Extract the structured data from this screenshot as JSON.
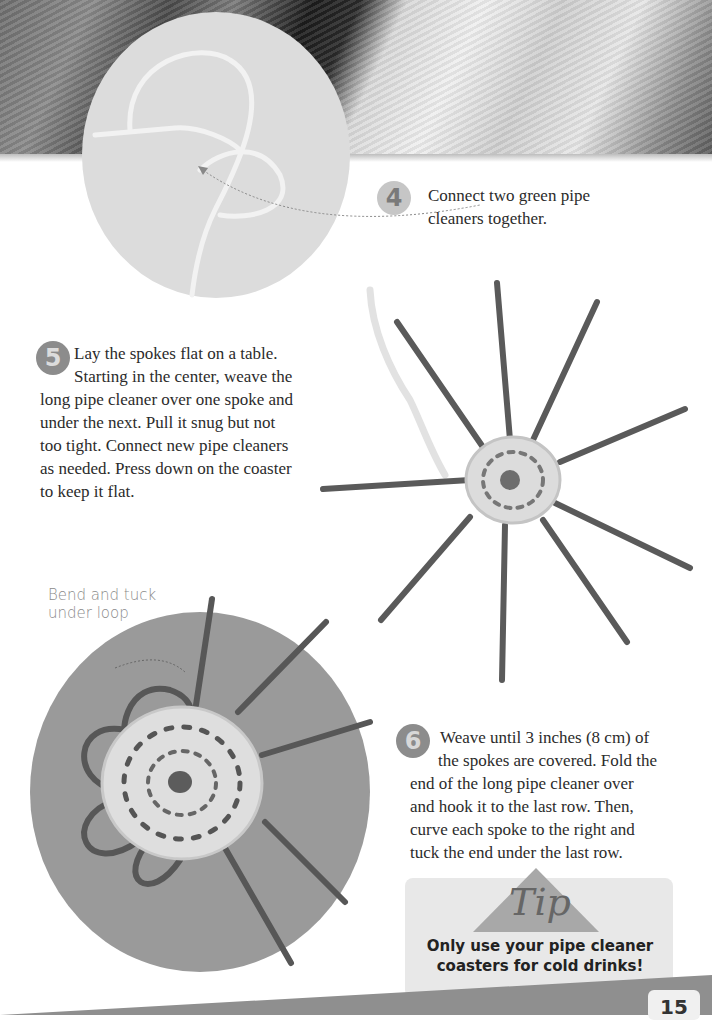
{
  "steps": [
    {
      "number": "4",
      "lines": [
        "Connect two green pipe",
        "cleaners together."
      ]
    },
    {
      "number": "5",
      "lines": [
        "Lay the spokes flat on a table.",
        "Starting in the center, weave the",
        "long pipe cleaner over one spoke and",
        "under the next. Pull it snug but not",
        "too tight. Connect new pipe cleaners",
        "as needed. Press down on the coaster",
        "to keep it flat."
      ]
    },
    {
      "number": "6",
      "lines": [
        "Weave until 3 inches (8 cm) of",
        "the spokes are covered. Fold the",
        "end of the long pipe cleaner over",
        "and hook it to the last row. Then,",
        "curve each spoke to the right and",
        "tuck the end under the last row."
      ]
    }
  ],
  "caption": {
    "lines": [
      "Bend and tuck",
      "under loop"
    ]
  },
  "tip": {
    "label": "Tip",
    "lines": [
      "Only use your pipe cleaner",
      "coasters for cold drinks!"
    ]
  },
  "page_number": "15",
  "images": {
    "banner": "pipe-cleaners-closeup-photo",
    "step4": "two-pipe-cleaners-joined-photo",
    "step5": "woven-coaster-with-spokes-photo",
    "step6": "finished-coaster-with-loops-photo"
  }
}
